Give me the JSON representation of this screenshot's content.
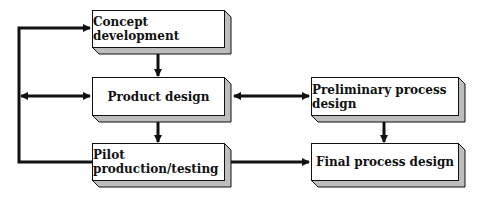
{
  "diagram": {
    "type": "flowchart",
    "nodes": [
      {
        "id": "concept",
        "label": "Concept development"
      },
      {
        "id": "product",
        "label": "Product design"
      },
      {
        "id": "pilot",
        "label": "Pilot production/testing"
      },
      {
        "id": "prelim",
        "label": "Preliminary process design"
      },
      {
        "id": "final",
        "label": "Final process design"
      }
    ],
    "edges": [
      {
        "from": "concept",
        "to": "product",
        "direction": "one-way"
      },
      {
        "from": "product",
        "to": "pilot",
        "direction": "one-way"
      },
      {
        "from": "product",
        "to": "prelim",
        "direction": "two-way"
      },
      {
        "from": "prelim",
        "to": "final",
        "direction": "one-way"
      },
      {
        "from": "pilot",
        "to": "final",
        "direction": "one-way"
      },
      {
        "from": "pilot",
        "to": "concept",
        "direction": "feedback-loop"
      },
      {
        "from": "feedback-loop",
        "to": "product",
        "direction": "two-way"
      }
    ],
    "colors": {
      "line": "#111111",
      "box_fill": "#ffffff",
      "box_shadow": "#bdbdbd"
    }
  }
}
